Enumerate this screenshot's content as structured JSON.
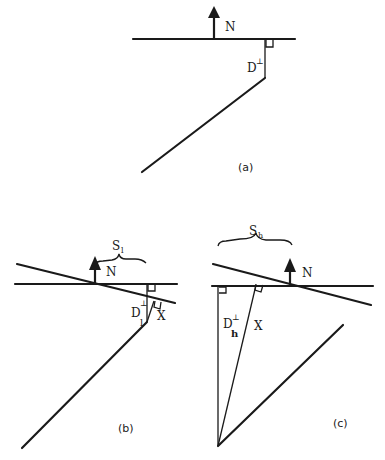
{
  "panels": {
    "a": {
      "caption": "(a)",
      "north_label": "N",
      "distance_label": "D",
      "distance_superscript": "⊥"
    },
    "b": {
      "caption": "(b)",
      "north_label": "N",
      "distance_label": "D",
      "distance_superscript": "⊥",
      "distance_subscript": "l",
      "x_label": "X",
      "brace_label": "S",
      "brace_subscript": "l"
    },
    "c": {
      "caption": "(c)",
      "north_label": "N",
      "distance_label": "D",
      "distance_superscript": "⊥",
      "distance_subscript": "h",
      "x_label": "X",
      "brace_label": "S",
      "brace_subscript": "h"
    }
  }
}
